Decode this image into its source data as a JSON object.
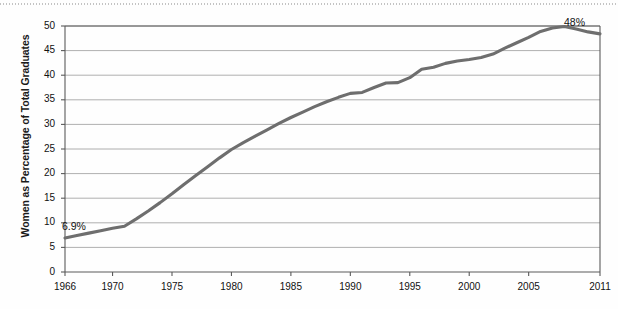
{
  "chart_data": {
    "type": "line",
    "title": "",
    "xlabel": "",
    "ylabel": "Women as Percentage of Total Graduates",
    "xlim": [
      1966,
      2011
    ],
    "ylim": [
      0,
      50
    ],
    "ygrid": true,
    "xgrid": false,
    "legend": "none",
    "line_color": "#6e6e6e",
    "grid_color": "#9a9a9a",
    "axis_color": "#5a5a5a",
    "y_ticks": [
      0,
      5,
      10,
      15,
      20,
      25,
      30,
      35,
      40,
      45,
      50
    ],
    "y_tick_labels": [
      "0",
      "5",
      "10",
      "15",
      "20",
      "25",
      "30",
      "35",
      "40",
      "45",
      "50"
    ],
    "x_ticks": [
      1966,
      1970,
      1975,
      1980,
      1985,
      1990,
      1995,
      2000,
      2005,
      2011
    ],
    "x_tick_labels": [
      "1966",
      "1970",
      "1975",
      "1980",
      "1985",
      "1990",
      "1995",
      "2000",
      "2005",
      "2011"
    ],
    "x": [
      1966,
      1967,
      1968,
      1969,
      1970,
      1971,
      1972,
      1973,
      1974,
      1975,
      1976,
      1977,
      1978,
      1979,
      1980,
      1981,
      1982,
      1983,
      1984,
      1985,
      1986,
      1987,
      1988,
      1989,
      1990,
      1991,
      1992,
      1993,
      1994,
      1995,
      1996,
      1997,
      1998,
      1999,
      2000,
      2001,
      2002,
      2003,
      2004,
      2005,
      2006,
      2007,
      2008,
      2009,
      2010,
      2011
    ],
    "values": [
      6.9,
      7.4,
      7.9,
      8.4,
      8.9,
      9.3,
      10.8,
      12.4,
      14.1,
      15.9,
      17.8,
      19.6,
      21.4,
      23.2,
      24.9,
      26.3,
      27.6,
      28.9,
      30.2,
      31.4,
      32.5,
      33.6,
      34.6,
      35.5,
      36.3,
      36.5,
      37.5,
      38.4,
      38.5,
      39.5,
      41.2,
      41.6,
      42.4,
      42.9,
      43.2,
      43.6,
      44.3,
      45.5,
      46.6,
      47.7,
      48.9,
      49.6,
      49.9,
      49.4,
      48.8,
      48.4
    ],
    "annotations": [
      {
        "label": "6.9%",
        "x": 1966,
        "y": 6.9,
        "position": "above-left"
      },
      {
        "label": "48%",
        "x": 2011,
        "y": 48.4,
        "position": "below-left"
      }
    ]
  }
}
